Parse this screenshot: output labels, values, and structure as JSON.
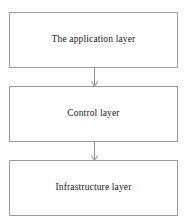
{
  "diagram": {
    "type": "vertical-layered-architecture",
    "title": "",
    "background_color": "#fefefe",
    "box_fill_color": "#ffffff",
    "box_border_color": "#9a9a9a",
    "text_color": "#171717",
    "arrow_color": "#8d8d8d",
    "layers": [
      {
        "id": "application",
        "label": "The application layer"
      },
      {
        "id": "control",
        "label": "Control layer"
      },
      {
        "id": "infrastructure",
        "label": "Infrastructure layer"
      }
    ],
    "connectors": [
      {
        "id": "application-to-control",
        "direction": "down",
        "icon": "arrow-down-icon"
      },
      {
        "id": "control-to-infrastructure",
        "direction": "down",
        "icon": "arrow-down-icon"
      }
    ]
  }
}
